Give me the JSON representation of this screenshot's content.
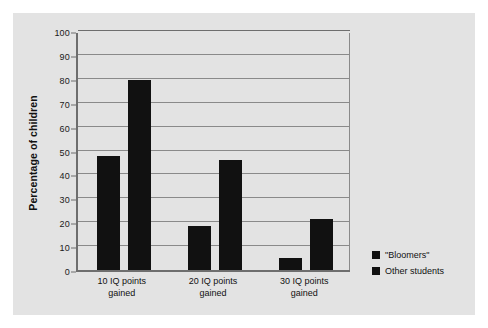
{
  "chart_data": {
    "type": "bar",
    "title": "",
    "xlabel": "",
    "ylabel": "Percentage of children",
    "ylim": [
      0,
      100
    ],
    "ytick_step": 10,
    "grid": true,
    "legend_position": "bottom-right-outside",
    "bar_color": "#111111",
    "panel_color": "#e3e3e3",
    "gridline_color": "#8a8a8a",
    "axis_color": "#6e6e6e",
    "categories": [
      "10 IQ points gained",
      "20 IQ points gained",
      "30 IQ points gained"
    ],
    "category_lines": [
      [
        "10 IQ points",
        "gained"
      ],
      [
        "20 IQ points",
        "gained"
      ],
      [
        "30 IQ points",
        "gained"
      ]
    ],
    "yticks": [
      "0",
      "10",
      "20",
      "30",
      "40",
      "50",
      "60",
      "70",
      "80",
      "90",
      "100"
    ],
    "series": [
      {
        "name": "\"Bloomers\"",
        "values": [
          47.5,
          18.5,
          5.0
        ]
      },
      {
        "name": "Other students",
        "values": [
          79.5,
          46.0,
          21.5
        ]
      }
    ]
  },
  "legend": {
    "items": [
      {
        "label": "\"Bloomers\""
      },
      {
        "label": "Other students"
      }
    ]
  }
}
